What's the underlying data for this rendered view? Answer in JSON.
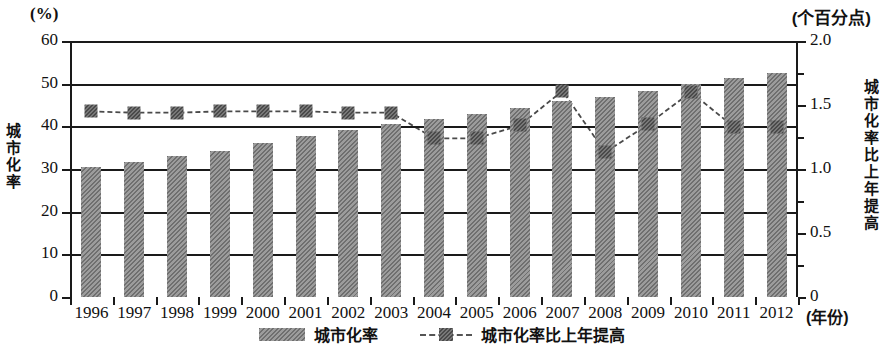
{
  "units": {
    "left": "(%)",
    "right": "(个百分点)",
    "x": "(年份)"
  },
  "axis_titles": {
    "left": "城市化率",
    "right": "城市化率比上年提高"
  },
  "legend": [
    {
      "label": "城市化率",
      "marker": "bar-hatched-swatch"
    },
    {
      "label": "城市化率比上年提高",
      "marker": "dashed-line-square-marker"
    }
  ],
  "chart_data": {
    "type": "bar",
    "title": "",
    "subtitle": "",
    "xlabel": "(年份)",
    "ylabel": "城市化率",
    "y2label": "城市化率比上年提高",
    "ylim": [
      0,
      60
    ],
    "y2lim": [
      0,
      2.0
    ],
    "yticks": [
      0,
      10,
      20,
      30,
      40,
      50,
      60
    ],
    "y2ticks": [
      0,
      0.5,
      1.0,
      1.5,
      2.0
    ],
    "y2minorticks": [
      0.25,
      0.75,
      1.25,
      1.75
    ],
    "grid": true,
    "legend_position": "bottom-center",
    "categories": [
      "1996",
      "1997",
      "1998",
      "1999",
      "2000",
      "2001",
      "2002",
      "2003",
      "2004",
      "2005",
      "2006",
      "2007",
      "2008",
      "2009",
      "2010",
      "2011",
      "2012"
    ],
    "series": [
      {
        "name": "城市化率",
        "type": "bar",
        "axis": "left",
        "unit": "%",
        "values": [
          30.5,
          31.6,
          33.1,
          34.3,
          36.2,
          37.7,
          39.1,
          40.5,
          41.8,
          43.0,
          44.3,
          45.9,
          46.9,
          48.3,
          50.0,
          51.3,
          52.6
        ]
      },
      {
        "name": "城市化率比上年提高",
        "type": "line",
        "axis": "right",
        "unit": "个百分点",
        "values": [
          1.45,
          1.44,
          1.44,
          1.45,
          1.45,
          1.45,
          1.44,
          1.44,
          1.24,
          1.24,
          1.34,
          1.61,
          1.13,
          1.35,
          1.6,
          1.33,
          1.33
        ]
      }
    ]
  }
}
